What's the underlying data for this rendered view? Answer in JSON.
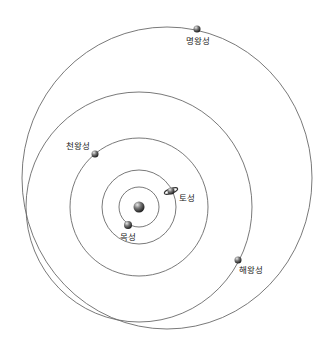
{
  "diagram": {
    "type": "solar-system-outer-planets-orbits",
    "sun": {
      "cx": 139,
      "cy": 207,
      "r": 5.5
    },
    "orbits": [
      {
        "name": "jupiter-orbit",
        "cx": 139,
        "cy": 207,
        "rx": 20,
        "ry": 20
      },
      {
        "name": "saturn-orbit",
        "cx": 139,
        "cy": 207,
        "rx": 37,
        "ry": 37
      },
      {
        "name": "uranus-orbit",
        "cx": 139,
        "cy": 207,
        "rx": 69,
        "ry": 69
      },
      {
        "name": "neptune-orbit",
        "cx": 139,
        "cy": 207,
        "rx": 113,
        "ry": 115
      },
      {
        "name": "pluto-orbit",
        "cx": 167,
        "cy": 178,
        "rx": 145,
        "ry": 151
      }
    ],
    "planets": [
      {
        "id": "jupiter",
        "label": "목성",
        "x": 128,
        "y": 225,
        "r": 4,
        "label_x": 120,
        "label_y": 240
      },
      {
        "id": "saturn",
        "label": "토성",
        "x": 171,
        "y": 191,
        "r": 3.5,
        "label_x": 179,
        "label_y": 201,
        "ringed": true
      },
      {
        "id": "uranus",
        "label": "천왕성",
        "x": 95,
        "y": 154,
        "r": 3.5,
        "label_x": 66,
        "label_y": 149
      },
      {
        "id": "neptune",
        "label": "해왕성",
        "x": 238,
        "y": 260,
        "r": 3.5,
        "label_x": 239,
        "label_y": 273
      },
      {
        "id": "pluto",
        "label": "명왕성",
        "x": 197,
        "y": 29,
        "r": 3.5,
        "label_x": 186,
        "label_y": 44
      }
    ],
    "labels": {
      "jupiter": "목성",
      "saturn": "토성",
      "uranus": "천왕성",
      "neptune": "해왕성",
      "pluto": "명왕성"
    }
  }
}
